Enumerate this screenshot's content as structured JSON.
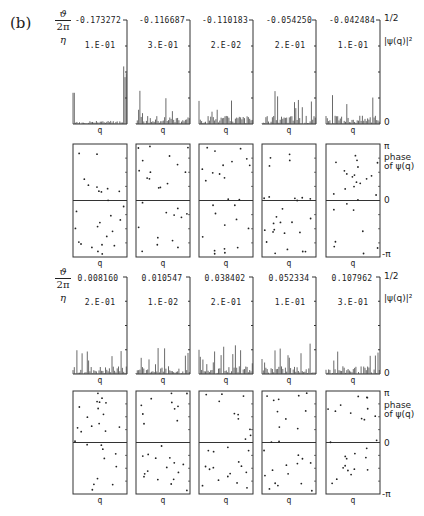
{
  "figure_label": "(b)",
  "row_labels": {
    "theta_num": "ϑ",
    "theta_den": "2π",
    "eta": "η"
  },
  "right_labels": {
    "amp_top": "1/2",
    "amp_name": "|ψ(q)|²",
    "amp_zero": "0",
    "phase_top": "π",
    "phase_name_1": "phase",
    "phase_name_2": "of ψ(q)",
    "phase_zero": "0",
    "phase_bottom": "-π"
  },
  "axis_label_q": "q",
  "chart_data": [
    {
      "type": "bar",
      "title": "Eigenstate amplitudes |ψ(q)|², top group (negative quasi-energies)",
      "xlabel": "q",
      "ylabel": "|ψ(q)|²",
      "ylim": [
        0,
        0.5
      ],
      "panels": [
        {
          "theta_over_2pi": "-0.173272",
          "eta": "1.E-01",
          "profile": "localized; strong peak at right edge (~0.35), secondary at left (~0.13)"
        },
        {
          "theta_over_2pi": "-0.116687",
          "eta": "3.E-01",
          "profile": "spread; max ~0.08 near left"
        },
        {
          "theta_over_2pi": "-0.110183",
          "eta": "2.E-02",
          "profile": "spread; max ~0.05"
        },
        {
          "theta_over_2pi": "-0.054250",
          "eta": "2.E-01",
          "profile": "spread; max ~0.08"
        },
        {
          "theta_over_2pi": "-0.042484",
          "eta": "1.E-01",
          "profile": "spread; peaks ~0.1 and ~0.08"
        }
      ]
    },
    {
      "type": "scatter",
      "title": "Phase of ψ(q), top group",
      "xlabel": "q",
      "ylabel": "phase of ψ(q)",
      "ylim": [
        "-π",
        "π"
      ],
      "panels": [
        "-0.173272",
        "-0.116687",
        "-0.110183",
        "-0.054250",
        "-0.042484"
      ]
    },
    {
      "type": "bar",
      "title": "Eigenstate amplitudes |ψ(q)|², bottom group (positive quasi-energies)",
      "xlabel": "q",
      "ylabel": "|ψ(q)|²",
      "ylim": [
        0,
        0.5
      ],
      "panels": [
        {
          "theta_over_2pi": "0.008160",
          "eta": "2.E-01",
          "profile": "left peak ~0.25, others ~0.08"
        },
        {
          "theta_over_2pi": "0.010547",
          "eta": "1.E-02",
          "profile": "spread; max ~0.08"
        },
        {
          "theta_over_2pi": "0.038402",
          "eta": "2.E-01",
          "profile": "spread; max ~0.08"
        },
        {
          "theta_over_2pi": "0.052334",
          "eta": "1.E-01",
          "profile": "spread; max ~0.06"
        },
        {
          "theta_over_2pi": "0.107962",
          "eta": "3.E-01",
          "profile": "spread; max ~0.08"
        }
      ]
    },
    {
      "type": "scatter",
      "title": "Phase of ψ(q), bottom group",
      "xlabel": "q",
      "ylabel": "phase of ψ(q)",
      "ylim": [
        "-π",
        "π"
      ],
      "panels": [
        "0.008160",
        "0.010547",
        "0.038402",
        "0.052334",
        "0.107962"
      ]
    }
  ],
  "groups": [
    {
      "thetas": [
        "-0.173272",
        "-0.116687",
        "-0.110183",
        "-0.054250",
        "-0.042484"
      ],
      "etas": [
        "1.E-01",
        "3.E-01",
        "2.E-02",
        "2.E-01",
        "1.E-01"
      ]
    },
    {
      "thetas": [
        "0.008160",
        "0.010547",
        "0.038402",
        "0.052334",
        "0.107962"
      ],
      "etas": [
        "2.E-01",
        "1.E-02",
        "2.E-01",
        "1.E-01",
        "3.E-01"
      ]
    }
  ]
}
